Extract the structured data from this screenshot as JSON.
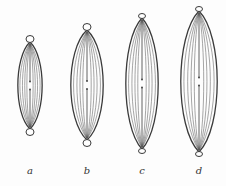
{
  "figure": {
    "stroke_color": "#3a3a3a",
    "inner_color": "#6a6a6a",
    "items": [
      {
        "label": "a",
        "cx": 30,
        "top": 36,
        "bottom": 135,
        "half_width": 12,
        "bulb": true
      },
      {
        "label": "b",
        "cx": 87,
        "top": 24,
        "bottom": 146,
        "half_width": 16,
        "bulb": true
      },
      {
        "label": "c",
        "cx": 142,
        "top": 14,
        "bottom": 153,
        "half_width": 16,
        "bulb": false
      },
      {
        "label": "d",
        "cx": 199,
        "top": 7,
        "bottom": 156,
        "half_width": 18,
        "bulb": false
      }
    ],
    "label_y": 165
  }
}
